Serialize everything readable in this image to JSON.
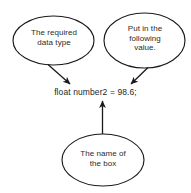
{
  "diagram": {
    "type": "annotated-code-diagram",
    "background_color": "#ffffff",
    "stroke_color": "#1a1a1a",
    "text_color": "#2b2b2b",
    "code": {
      "text": "float number2 = 98.6;",
      "tokens": {
        "type_keyword": "float",
        "variable_name": "number2",
        "assignment_operator": "=",
        "literal_value": "98.6",
        "terminator": ";"
      }
    },
    "callouts": [
      {
        "id": "data-type",
        "text": "The required\ndata type",
        "lines": [
          "The required",
          "data type"
        ],
        "points_to": "float",
        "position": "top-left"
      },
      {
        "id": "value",
        "text": "Put in the\nfollowing\nvalue.",
        "lines": [
          "Put in the",
          "following",
          "value."
        ],
        "points_to": "98.6",
        "position": "top-right"
      },
      {
        "id": "name",
        "text": "The name of\nthe box",
        "lines": [
          "The name of",
          "the box"
        ],
        "points_to": "number2",
        "position": "bottom-center"
      }
    ],
    "arrows": [
      {
        "id": "arrow-data-type-to-float",
        "from": "data-type",
        "to": "float",
        "direction": "down-right"
      },
      {
        "id": "arrow-value-to-literal",
        "from": "value",
        "to": "98.6",
        "direction": "down-left"
      },
      {
        "id": "arrow-name-to-variable",
        "from": "name",
        "to": "number2",
        "direction": "up"
      }
    ]
  }
}
